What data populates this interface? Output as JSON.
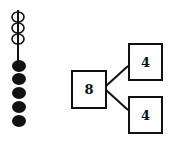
{
  "abacus": {
    "hollow_beads": 3,
    "filled_beads": 5
  },
  "number_bond": {
    "whole": "8",
    "parts": [
      "4",
      "4"
    ]
  }
}
